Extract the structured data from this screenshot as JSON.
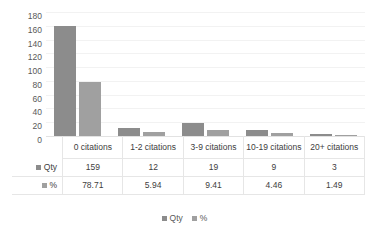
{
  "chart_data": {
    "type": "bar",
    "title": "",
    "xlabel": "",
    "ylabel": "Total",
    "ylim": [
      0,
      180
    ],
    "yticks": [
      180,
      160,
      140,
      120,
      100,
      80,
      60,
      40,
      20,
      0
    ],
    "grid": true,
    "legend_position": "bottom",
    "categories": [
      "0 citations",
      "1-2 citations",
      "3-9 citations",
      "10-19 citations",
      "20+ citations"
    ],
    "series": [
      {
        "name": "Qty",
        "color": "#8c8c8c",
        "values": [
          159,
          12,
          19,
          9,
          3
        ]
      },
      {
        "name": "%",
        "color": "#a0a0a0",
        "values": [
          78.71,
          5.94,
          9.41,
          4.46,
          1.49
        ]
      }
    ]
  },
  "data_table": {
    "row_labels": [
      "Qty",
      "%"
    ],
    "rows": [
      [
        "159",
        "12",
        "19",
        "9",
        "3"
      ],
      [
        "78.71",
        "5.94",
        "9.41",
        "4.46",
        "1.49"
      ]
    ]
  },
  "legend": {
    "items": [
      {
        "label": "Qty",
        "color": "#8c8c8c"
      },
      {
        "label": "%",
        "color": "#a0a0a0"
      }
    ]
  },
  "colors": {
    "qty": "#8c8c8c",
    "pct": "#a0a0a0",
    "gridline": "#f2f2f2",
    "axis_text": "#595959",
    "table_border": "#e6e6e6",
    "background": "#ffffff"
  }
}
